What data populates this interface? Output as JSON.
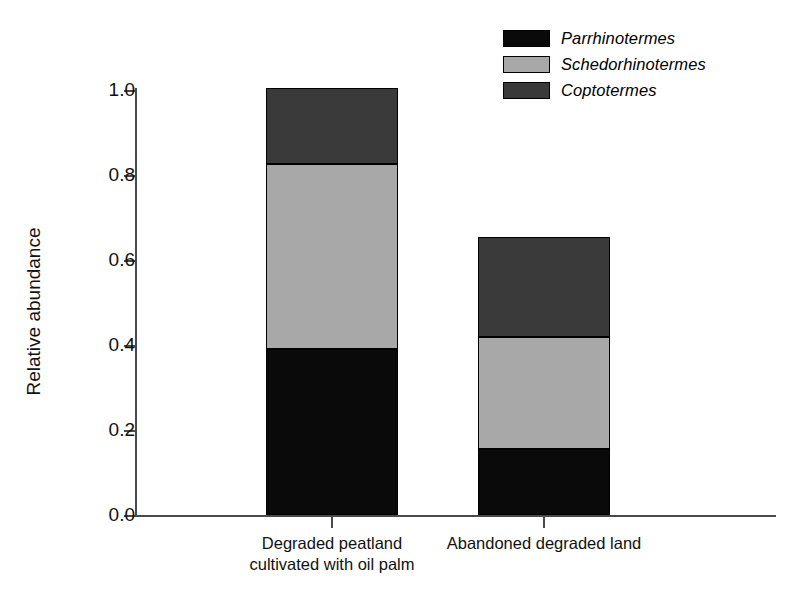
{
  "chart_data": {
    "type": "bar",
    "subtype": "stacked",
    "title": "",
    "xlabel": "",
    "ylabel": "Relative abundance",
    "ylim": [
      0.0,
      1.0
    ],
    "yticks": [
      "0.0",
      "0.2",
      "0.4",
      "0.6",
      "0.8",
      "1.0"
    ],
    "ytick_values": [
      0.0,
      0.2,
      0.4,
      0.6,
      0.8,
      1.0
    ],
    "grid": false,
    "legend_position": "top-right",
    "categories": [
      "Degraded peatland\ncultivated with oil palm",
      "Abandoned degraded land"
    ],
    "series": [
      {
        "name": "Parrhinotermes",
        "color": "#0a0a0a",
        "italic": true,
        "values": [
          0.39,
          0.155
        ]
      },
      {
        "name": "Schedorhinotermes",
        "color": "#a8a8a8",
        "italic": true,
        "values": [
          0.435,
          0.265
        ]
      },
      {
        "name": "Coptotermes",
        "color": "#3a3a3a",
        "italic": true,
        "values": [
          0.18,
          0.235
        ]
      }
    ],
    "stack_totals": [
      1.005,
      0.655
    ]
  },
  "axis": {
    "line_color": "#4a4a4a"
  }
}
